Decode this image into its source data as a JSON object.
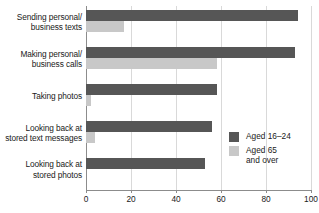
{
  "chart_data": {
    "type": "bar",
    "orientation": "horizontal",
    "title": "",
    "subtitle": "",
    "xlabel": "",
    "ylabel": "",
    "xlim": [
      0,
      100
    ],
    "xticks": [
      0,
      20,
      40,
      60,
      80,
      100
    ],
    "xtick_labels": [
      "0",
      "20",
      "40",
      "60",
      "80",
      "100"
    ],
    "grid": true,
    "grid_axis": "x",
    "legend_position": "middle-right",
    "categories": [
      "Sending personal/\nbusiness texts",
      "Making personal/\nbusiness calls",
      "Taking photos",
      "Looking back at\nstored text messages",
      "Looking back at\nstored photos"
    ],
    "series": [
      {
        "name": "Aged 16–24",
        "color": "#565656",
        "values": [
          94,
          93,
          58,
          56,
          53
        ]
      },
      {
        "name": "Aged 65\nand over",
        "color": "#c8c8c8",
        "values": [
          17,
          58,
          2,
          4,
          0
        ]
      }
    ]
  },
  "legend": {
    "items": [
      {
        "label": "Aged 16–24",
        "color": "#565656"
      },
      {
        "label": "Aged 65\nand over",
        "color": "#c8c8c8"
      }
    ]
  },
  "colors": {
    "series_dark": "#565656",
    "series_light": "#c8c8c8",
    "gridline": "#d9d9d9",
    "axis": "#8c8c8c",
    "text": "#1a1a1a",
    "background": "#ffffff"
  }
}
